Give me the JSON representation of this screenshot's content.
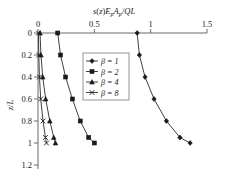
{
  "chart_data": {
    "type": "line",
    "title": "s(z)EpAp/QL",
    "title_parts": {
      "s_of_z": "s(z)",
      "E": "E",
      "p1": "p",
      "A": "A",
      "p2": "p",
      "slash_QL": "/QL"
    },
    "xlabel": "s(z)EpAp/QL",
    "ylabel": "z/L",
    "xlim": [
      0,
      1.5
    ],
    "ylim": [
      0,
      1.2
    ],
    "y_inverted": true,
    "grid": false,
    "x_ticks": [
      "0",
      "0.5",
      "1",
      "1.5"
    ],
    "x_tick_values": [
      0,
      0.5,
      1,
      1.5
    ],
    "y_ticks": [
      "0",
      "0.2",
      "0.4",
      "0.6",
      "0.8",
      "1",
      "1.2"
    ],
    "y_tick_values": [
      0,
      0.2,
      0.4,
      0.6,
      0.8,
      1,
      1.2
    ],
    "legend_position": "center",
    "series": [
      {
        "name": "β = 1",
        "beta": 1,
        "marker": "diamond",
        "x": [
          0.88,
          0.9,
          0.95,
          1.03,
          1.14,
          1.26,
          1.35
        ],
        "y": [
          0,
          0.2,
          0.4,
          0.6,
          0.8,
          0.95,
          1.0
        ]
      },
      {
        "name": "β = 2",
        "beta": 2,
        "marker": "square",
        "x": [
          0.175,
          0.2,
          0.245,
          0.305,
          0.375,
          0.45,
          0.5
        ],
        "y": [
          0,
          0.2,
          0.4,
          0.6,
          0.8,
          0.95,
          1.0
        ]
      },
      {
        "name": "β = 4",
        "beta": 4,
        "marker": "triangle",
        "x": [
          0.018,
          0.026,
          0.042,
          0.068,
          0.105,
          0.14,
          0.155
        ],
        "y": [
          0,
          0.2,
          0.4,
          0.6,
          0.8,
          0.95,
          1.0
        ]
      },
      {
        "name": "β = 8",
        "beta": 8,
        "marker": "x",
        "x": [
          0.004,
          0.007,
          0.013,
          0.024,
          0.045,
          0.066,
          0.075
        ],
        "y": [
          0,
          0.2,
          0.4,
          0.6,
          0.8,
          0.95,
          1.0
        ]
      }
    ],
    "colors": {
      "curve": "#2b2b2b",
      "axis": "#6b6b6b",
      "text": "#1a1a1a",
      "legend_border": "#8a8a8a",
      "background": "#ffffff"
    }
  },
  "legend": {
    "items": [
      {
        "label": "β = 1",
        "beta_sym": "β",
        "eq": "= 1"
      },
      {
        "label": "β = 2",
        "beta_sym": "β",
        "eq": "= 2"
      },
      {
        "label": "β = 4",
        "beta_sym": "β",
        "eq": "= 4"
      },
      {
        "label": "β = 8",
        "beta_sym": "β",
        "eq": "= 8"
      }
    ]
  }
}
